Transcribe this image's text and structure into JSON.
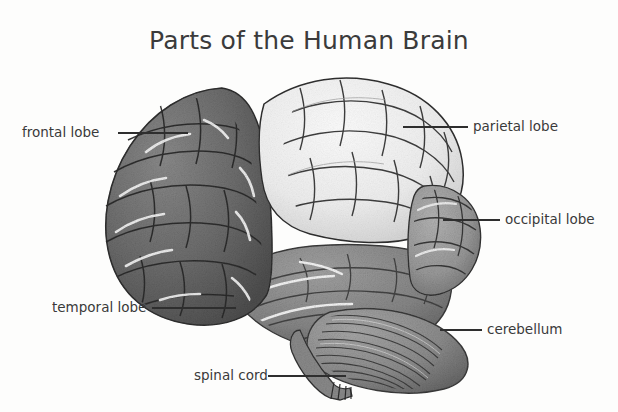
{
  "figure": {
    "title": "Parts of the Human Brain",
    "background_color": "#fdfdfc",
    "text_color": "#3a3a3a",
    "leader_color": "#2e2e2e",
    "image_type": "grayscale-anatomical-illustration"
  },
  "labels": [
    {
      "id": "frontal-lobe",
      "text": "frontal lobe",
      "side": "left",
      "text_x": 22,
      "text_y": 127,
      "leader_x1": 118,
      "leader_x2": 188,
      "leader_y": 133
    },
    {
      "id": "parietal-lobe",
      "text": "parietal lobe",
      "side": "right",
      "text_x": 473,
      "text_y": 120,
      "leader_x1": 403,
      "leader_x2": 468,
      "leader_y": 127
    },
    {
      "id": "occipital-lobe",
      "text": "occipital lobe",
      "side": "right",
      "text_x": 505,
      "text_y": 213,
      "leader_x1": 443,
      "leader_x2": 500,
      "leader_y": 220
    },
    {
      "id": "cerebellum",
      "text": "cerebellum",
      "side": "right",
      "text_x": 487,
      "text_y": 323,
      "leader_x1": 440,
      "leader_x2": 482,
      "leader_y": 330
    },
    {
      "id": "temporal-lobe",
      "text": "temporal lobe",
      "side": "left",
      "text_x": 52,
      "text_y": 301,
      "leader_x1": 152,
      "leader_x2": 236,
      "leader_y": 308
    },
    {
      "id": "spinal-cord",
      "text": "spinal cord",
      "side": "left",
      "text_x": 194,
      "text_y": 369,
      "leader_x1": 268,
      "leader_x2": 346,
      "leader_y": 376
    }
  ],
  "regions": [
    {
      "id": "frontal-lobe",
      "name": "Frontal lobe",
      "tone": "dark-gray",
      "fill": "#6d6d6d"
    },
    {
      "id": "parietal-lobe",
      "name": "Parietal lobe",
      "tone": "light",
      "fill": "#ededed"
    },
    {
      "id": "occipital-lobe",
      "name": "Occipital lobe",
      "tone": "mid-gray",
      "fill": "#9a9a9a"
    },
    {
      "id": "temporal-lobe",
      "name": "Temporal lobe",
      "tone": "mid-gray",
      "fill": "#8a8a8a"
    },
    {
      "id": "cerebellum",
      "name": "Cerebellum",
      "tone": "mid-gray",
      "fill": "#8f8f8f"
    },
    {
      "id": "spinal-cord",
      "name": "Spinal cord",
      "tone": "mid-gray",
      "fill": "#8a8a8a"
    }
  ]
}
